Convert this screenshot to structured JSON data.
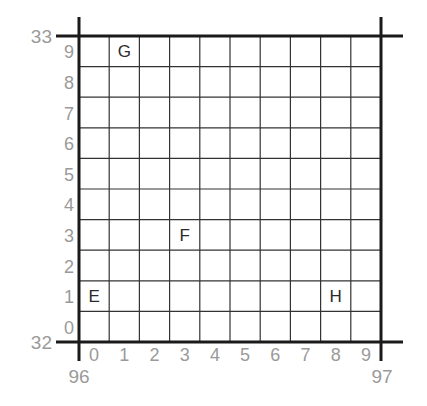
{
  "diagram": {
    "type": "grid-reference-square",
    "colors": {
      "grid_line": "#333333",
      "axis_line": "#1a1a1a",
      "tick_label": "#9a9a9a",
      "point_label": "#2a2a2a",
      "background": "#ffffff"
    },
    "corners": {
      "top_left_y": "33",
      "bottom_left_y": "32",
      "bottom_left_x": "96",
      "bottom_right_x": "97"
    },
    "x_ticks": [
      "0",
      "1",
      "2",
      "3",
      "4",
      "5",
      "6",
      "7",
      "8",
      "9"
    ],
    "y_ticks": [
      "0",
      "1",
      "2",
      "3",
      "4",
      "5",
      "6",
      "7",
      "8",
      "9"
    ],
    "points": [
      {
        "label": "G",
        "col": 1,
        "row": 9
      },
      {
        "label": "F",
        "col": 3,
        "row": 3
      },
      {
        "label": "E",
        "col": 0,
        "row": 1
      },
      {
        "label": "H",
        "col": 8,
        "row": 1
      }
    ]
  }
}
